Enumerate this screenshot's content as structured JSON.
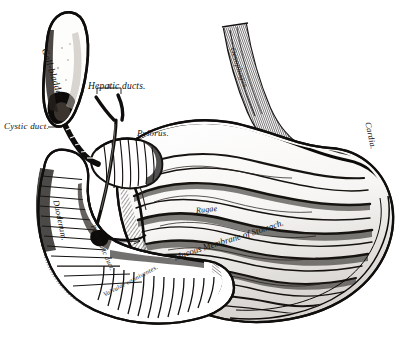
{
  "plate": {
    "title": "The Stomach and Duodenum, laid open to show the Mucous Membrane",
    "medium": "black-and-white line engraving",
    "background_color": "#ffffff",
    "ink_color": "#151210",
    "width": 404,
    "height": 341
  },
  "labels": {
    "gall_bladder": "Gall-bladder.",
    "hepatic_ducts": "Hepatic ducts.",
    "cystic_duct": "Cystic duct.",
    "pylorus": "Pylorus.",
    "oesophagus": "Oesophagus.",
    "cardia": "Cardia.",
    "duodenum": "Duodenum.",
    "pancreatic_duct": "Pancreatic duct.",
    "rugae": "Rugae",
    "mucous_membrane": "Mucous Membrane of Stomach.",
    "valvulae_conniventes": "Valvulae conniventes."
  },
  "structures": [
    {
      "name": "gall-bladder",
      "label": "Gall-bladder.",
      "region": "upper-left"
    },
    {
      "name": "cystic-duct",
      "label": "Cystic duct.",
      "region": "left"
    },
    {
      "name": "hepatic-ducts",
      "label": "Hepatic ducts.",
      "region": "upper-center"
    },
    {
      "name": "pylorus",
      "label": "Pylorus.",
      "region": "center"
    },
    {
      "name": "duodenum",
      "label": "Duodenum.",
      "region": "lower-left"
    },
    {
      "name": "pancreatic-duct",
      "label": "Pancreatic duct.",
      "region": "center-left"
    },
    {
      "name": "oesophagus",
      "label": "Oesophagus.",
      "region": "upper-right"
    },
    {
      "name": "cardia",
      "label": "Cardia.",
      "region": "right"
    },
    {
      "name": "rugae",
      "label": "Rugae",
      "region": "center-right"
    },
    {
      "name": "mucous-membrane-of-stomach",
      "label": "Mucous Membrane of Stomach.",
      "region": "lower-center"
    },
    {
      "name": "valvulae-conniventes",
      "label": "Valvulae conniventes.",
      "region": "bottom"
    }
  ]
}
